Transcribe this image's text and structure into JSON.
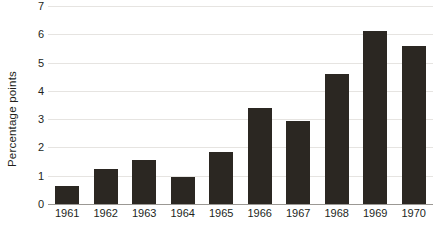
{
  "chart_data": {
    "type": "bar",
    "title": "",
    "subtitle": "",
    "xlabel": "",
    "ylabel": "Percentage points",
    "categories": [
      "1961",
      "1962",
      "1963",
      "1964",
      "1965",
      "1966",
      "1967",
      "1968",
      "1969",
      "1970"
    ],
    "values": [
      0.65,
      1.25,
      1.55,
      0.95,
      1.85,
      3.4,
      2.95,
      4.6,
      6.1,
      5.6
    ],
    "ylim": [
      0,
      7
    ],
    "y_ticks": [
      0,
      1,
      2,
      3,
      4,
      5,
      6,
      7
    ],
    "y_tick_labels": [
      "0",
      "1",
      "2",
      "3",
      "4",
      "5",
      "6",
      "7"
    ],
    "grid": true,
    "grid_axis": "y",
    "legend": false,
    "legend_position": "none",
    "bar_color": "#2b2722",
    "gridline_color": "#e6e4e1",
    "axis_color": "#9b9894",
    "background_color": "#ffffff",
    "text_color": "#231f1c"
  }
}
